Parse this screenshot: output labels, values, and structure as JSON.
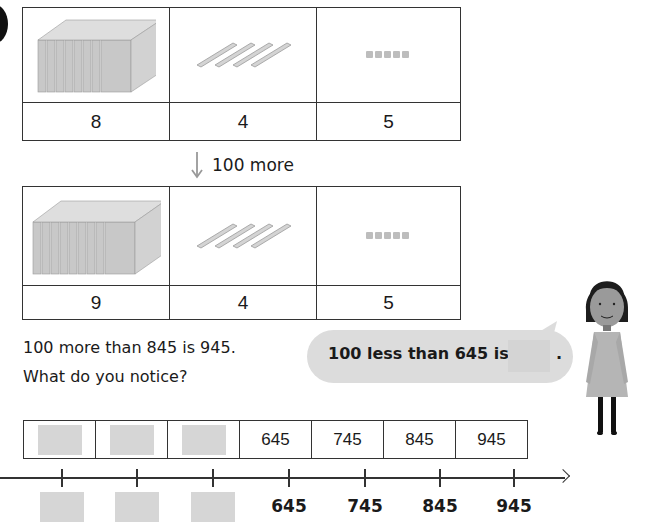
{
  "question_badge": "question-number-badge",
  "table_before": {
    "columns": [
      {
        "icon": "hundreds-flats-icon",
        "count": "8"
      },
      {
        "icon": "tens-rods-icon",
        "count": "4"
      },
      {
        "icon": "ones-cubes-icon",
        "count": "5"
      }
    ]
  },
  "transition": {
    "icon": "down-arrow-icon",
    "label": "100 more"
  },
  "table_after": {
    "columns": [
      {
        "icon": "hundreds-flats-icon",
        "count": "9"
      },
      {
        "icon": "tens-rods-icon",
        "count": "4"
      },
      {
        "icon": "ones-cubes-icon",
        "count": "5"
      }
    ]
  },
  "statement": {
    "line1": "100 more than 845 is 945.",
    "line2": "What do you notice?"
  },
  "speech_bubble": {
    "text": "100 less than 645 is",
    "suffix": ".",
    "answer": ""
  },
  "character": "girl-character",
  "number_strip": {
    "cells": [
      "",
      "",
      "",
      "645",
      "745",
      "845",
      "945"
    ]
  },
  "number_line": {
    "labels": [
      "",
      "",
      "",
      "645",
      "745",
      "845",
      "945"
    ]
  }
}
